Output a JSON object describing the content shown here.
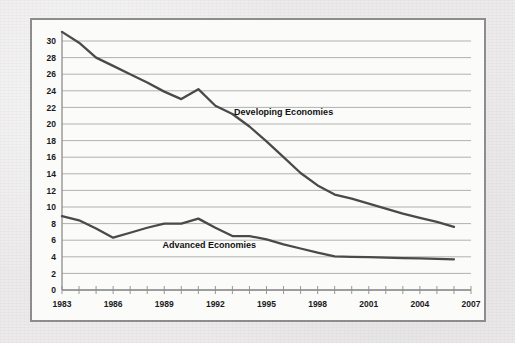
{
  "figure": {
    "background_color": "#eceaea",
    "frame_border_color": "#8d8d8d",
    "plot_background_color": "#fbfbfa",
    "gridline_color": "#a8a8a8",
    "axis_color": "#8d8d8d",
    "line_color": "#4a4a4a"
  },
  "chart_data": {
    "type": "line",
    "title": "",
    "subtitle": "",
    "xlabel": "",
    "ylabel": "",
    "xlim": [
      1983,
      2007
    ],
    "ylim": [
      0,
      31
    ],
    "grid": true,
    "grid_axis": "y",
    "legend_position": "inline-annotation",
    "y_ticks": [
      0,
      2,
      4,
      6,
      8,
      10,
      12,
      14,
      16,
      18,
      20,
      22,
      24,
      26,
      28,
      30
    ],
    "y_tick_labels": [
      "0",
      "2",
      "4",
      "6",
      "8",
      "10",
      "12",
      "14",
      "16",
      "18",
      "20",
      "22",
      "24",
      "26",
      "28",
      "30"
    ],
    "x_ticks": [
      1983,
      1984,
      1985,
      1986,
      1987,
      1988,
      1989,
      1990,
      1991,
      1992,
      1993,
      1994,
      1995,
      1996,
      1997,
      1998,
      1999,
      2000,
      2001,
      2002,
      2003,
      2004,
      2005,
      2006,
      2007
    ],
    "x_tick_labels_shown": [
      "1983",
      "1986",
      "1989",
      "1992",
      "1995",
      "1998",
      "2001",
      "2004",
      "2007"
    ],
    "x_label_years": [
      1983,
      1986,
      1989,
      1992,
      1995,
      1998,
      2001,
      2004,
      2007
    ],
    "series": [
      {
        "name": "Developing Economies",
        "label": "Developing Economies",
        "label_year": 1993.1,
        "label_value": 21.1,
        "color": "#4a4a4a",
        "x": [
          1983,
          1984,
          1985,
          1986,
          1987,
          1988,
          1989,
          1990,
          1991,
          1992,
          1993,
          1994,
          1995,
          1996,
          1997,
          1998,
          1999,
          2000,
          2001,
          2002,
          2003,
          2004,
          2005,
          2006
        ],
        "values": [
          31.1,
          29.8,
          28.0,
          27.0,
          26.0,
          25.0,
          23.9,
          23.0,
          24.2,
          22.2,
          21.2,
          19.7,
          17.9,
          16.0,
          14.1,
          12.6,
          11.5,
          11.0,
          10.4,
          9.8,
          9.2,
          8.7,
          8.2,
          7.6
        ]
      },
      {
        "name": "Advanced Economies",
        "label": "Advanced Economies",
        "label_year": 1988.9,
        "label_value": 5.1,
        "color": "#4a4a4a",
        "x": [
          1983,
          1984,
          1985,
          1986,
          1987,
          1988,
          1989,
          1990,
          1991,
          1992,
          1993,
          1994,
          1995,
          1996,
          1997,
          1998,
          1999,
          2000,
          2001,
          2002,
          2003,
          2004,
          2005,
          2006
        ],
        "values": [
          8.9,
          8.4,
          7.4,
          6.3,
          6.9,
          7.5,
          8.0,
          8.0,
          8.6,
          7.5,
          6.5,
          6.5,
          6.1,
          5.5,
          5.0,
          4.5,
          4.05,
          4.0,
          3.95,
          3.9,
          3.85,
          3.8,
          3.75,
          3.7
        ]
      }
    ]
  }
}
